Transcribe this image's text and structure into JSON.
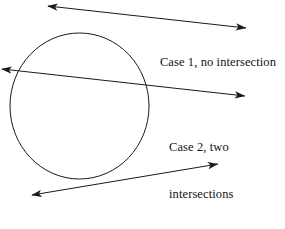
{
  "figure": {
    "background_color": "#ffffff",
    "stroke_color": "#1a1a1a",
    "text_color": "#141414",
    "width": 285,
    "height": 229
  },
  "shapes": {
    "circle": {
      "name": "circle",
      "center_x": 79.5,
      "center_y": 106,
      "radius_x": 69.5,
      "radius_y": 73
    },
    "lines": [
      {
        "name": "case-1-line",
        "description": "secant line passing entirely above the circle, no intersection",
        "x1": 48,
        "y1": 6,
        "x2": 246,
        "y2": 28,
        "arrow_start": true,
        "arrow_end": true
      },
      {
        "name": "case-2-line",
        "description": "line crossing the circle at two points",
        "x1": 2,
        "y1": 69,
        "x2": 245,
        "y2": 96,
        "arrow_start": true,
        "arrow_end": true
      },
      {
        "name": "case-3-line",
        "description": "line tangent to the circle, touching at one point",
        "x1": 32,
        "y1": 195,
        "x2": 218,
        "y2": 164,
        "arrow_start": true,
        "arrow_end": true
      }
    ]
  },
  "labels": {
    "case1": "Case 1, no intersection",
    "case2_line1": "Case 2, two",
    "case2_line2": "intersections",
    "case3_line1": "Case 3, tangent, one",
    "case3_line2": "intersection"
  }
}
